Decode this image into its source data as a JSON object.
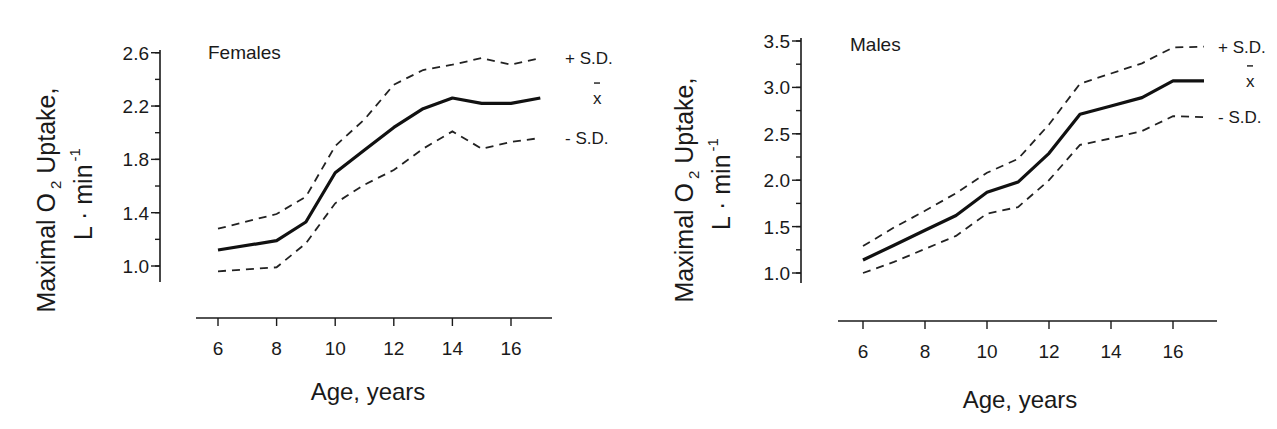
{
  "chart_data": [
    {
      "type": "line",
      "title": "Females",
      "xlabel": "Age, years",
      "ylabel_line1": "Maximal O",
      "ylabel_sub": "2",
      "ylabel_line1_end": " Uptake,",
      "ylabel_line2": "L · min",
      "ylabel_sup": "-1",
      "ylim": [
        0.9,
        2.64
      ],
      "xlim": [
        5,
        17.5
      ],
      "yticks": [
        1.0,
        1.4,
        1.8,
        2.2,
        2.6
      ],
      "ytick_labels": [
        "1.0",
        "1.4",
        "1.8",
        "2.2",
        "2.6"
      ],
      "yminor_step": 0.2,
      "xticks": [
        6,
        8,
        10,
        12,
        14,
        16
      ],
      "xtick_labels": [
        "6",
        "8",
        "10",
        "12",
        "14",
        "16"
      ],
      "grid": false,
      "x": [
        6,
        8,
        9,
        10,
        11,
        12,
        13,
        14,
        15,
        16,
        17
      ],
      "series": [
        {
          "name": "+ S.D.",
          "style": "dashed",
          "values": [
            1.28,
            1.39,
            1.52,
            1.9,
            2.1,
            2.36,
            2.47,
            2.51,
            2.56,
            2.51,
            2.56
          ]
        },
        {
          "name": "x̄",
          "style": "solid",
          "values": [
            1.12,
            1.19,
            1.33,
            1.7,
            1.87,
            2.04,
            2.18,
            2.26,
            2.22,
            2.22,
            2.26
          ]
        },
        {
          "name": "- S.D.",
          "style": "dashed",
          "values": [
            0.96,
            0.99,
            1.17,
            1.47,
            1.61,
            1.72,
            1.88,
            2.01,
            1.88,
            1.93,
            1.96
          ]
        }
      ]
    },
    {
      "type": "line",
      "title": "Males",
      "xlabel": "Age, years",
      "ylabel_line1": "Maximal O",
      "ylabel_sub": "2",
      "ylabel_line1_end": " Uptake,",
      "ylabel_line2": "L · min",
      "ylabel_sup": "-1",
      "ylim": [
        0.9,
        3.52
      ],
      "xlim": [
        5,
        17.5
      ],
      "yticks": [
        1.0,
        1.5,
        2.0,
        2.5,
        3.0,
        3.5
      ],
      "ytick_labels": [
        "1.0",
        "1.5",
        "2.0",
        "2.5",
        "3.0",
        "3.5"
      ],
      "yminor_step": 0.25,
      "xticks": [
        6,
        8,
        10,
        12,
        14,
        16
      ],
      "xtick_labels": [
        "6",
        "8",
        "10",
        "12",
        "14",
        "16"
      ],
      "grid": false,
      "x": [
        6,
        7,
        8,
        9,
        10,
        11,
        12,
        13,
        14,
        15,
        16,
        17
      ],
      "series": [
        {
          "name": "+ S.D.",
          "style": "dashed",
          "values": [
            1.29,
            1.49,
            1.67,
            1.86,
            2.08,
            2.23,
            2.6,
            3.04,
            3.15,
            3.26,
            3.43,
            3.44
          ]
        },
        {
          "name": "x̄",
          "style": "solid",
          "values": [
            1.14,
            1.3,
            1.46,
            1.62,
            1.87,
            1.98,
            2.29,
            2.71,
            2.8,
            2.89,
            3.07,
            3.07
          ]
        },
        {
          "name": "- S.D.",
          "style": "dashed",
          "values": [
            1.0,
            1.12,
            1.26,
            1.4,
            1.64,
            1.71,
            2.0,
            2.38,
            2.45,
            2.53,
            2.69,
            2.68
          ]
        }
      ]
    }
  ],
  "layout": {
    "female": {
      "yaxis_x": 160,
      "yaxis_top": 50,
      "yaxis_bottom": 282,
      "y_at_1": 266,
      "px_per_unit_y": 133.3,
      "xaxis_y": 318,
      "xaxis_left": 196,
      "xaxis_right": 552,
      "x_at_6": 218,
      "px_per_year": 29.3,
      "title_x": 208,
      "title_y": 59,
      "labels_x": 565,
      "xlabel_x": 368,
      "xlabel_y": 400,
      "ylabel_x": 55,
      "ylabel2_x": 92,
      "ylabel_cy": 200
    },
    "male": {
      "yaxis_x": 161,
      "yaxis_top": 38,
      "yaxis_bottom": 283,
      "y_at_1": 273,
      "px_per_unit_y": 92.8,
      "xaxis_y": 321,
      "xaxis_left": 198,
      "xaxis_right": 577,
      "x_at_6": 223,
      "px_per_year": 31.0,
      "title_x": 210,
      "title_y": 51,
      "labels_x": 578,
      "xlabel_x": 380,
      "xlabel_y": 408,
      "ylabel_x": 53,
      "ylabel2_x": 90,
      "ylabel_cy": 190
    }
  }
}
